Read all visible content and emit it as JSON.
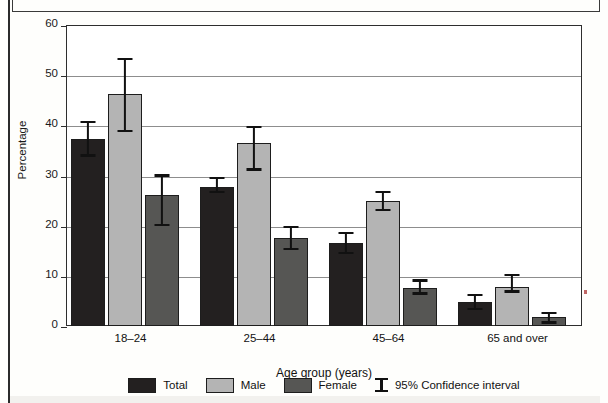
{
  "figure": {
    "ylabel": "Percentage",
    "xlabel": "Age group (years)"
  },
  "axis": {
    "y_ticks": [
      "60",
      "50",
      "40",
      "30",
      "20",
      "10",
      "0"
    ]
  },
  "legend": {
    "items": [
      {
        "label": "Total",
        "swatch": "total",
        "color": "#232020"
      },
      {
        "label": "Male",
        "swatch": "male",
        "color": "#b4b4b4"
      },
      {
        "label": "Female",
        "swatch": "female",
        "color": "#565654"
      }
    ],
    "ci_label": "95% Confidence interval",
    "ci_icon": "error-bar-icon"
  },
  "chart_data": {
    "type": "bar",
    "title": "",
    "subtitle": "",
    "xlabel": "Age group (years)",
    "ylabel": "Percentage",
    "ylim": [
      0,
      60
    ],
    "ytick_step": 10,
    "grid": "horizontal",
    "legend_position": "bottom",
    "categories": [
      "18–24",
      "25–44",
      "45–64",
      "65 and over"
    ],
    "series": [
      {
        "name": "Total",
        "color": "#232020",
        "values": [
          37.3,
          27.8,
          16.5,
          4.8
        ],
        "ci_low": [
          33.8,
          26.5,
          14.3,
          3.2
        ],
        "ci_high": [
          40.9,
          29.8,
          18.8,
          6.4
        ]
      },
      {
        "name": "Male",
        "color": "#b4b4b4",
        "values": [
          46.3,
          36.5,
          25.0,
          7.8
        ],
        "ci_low": [
          38.7,
          31.0,
          22.9,
          6.7
        ],
        "ci_high": [
          53.5,
          39.9,
          26.9,
          10.4
        ]
      },
      {
        "name": "Female",
        "color": "#565654",
        "values": [
          26.1,
          17.5,
          7.6,
          1.8
        ],
        "ci_low": [
          20.0,
          15.2,
          6.3,
          0.5
        ],
        "ci_high": [
          30.2,
          19.9,
          9.3,
          2.8
        ]
      }
    ],
    "error_bars": "95% Confidence interval"
  }
}
